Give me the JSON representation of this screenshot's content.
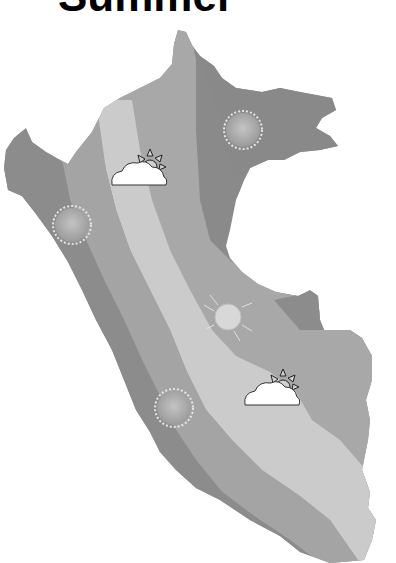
{
  "title": "Summer",
  "map": {
    "region": "Peru",
    "style": "grayscale climate zones",
    "zones": [
      {
        "name": "coast",
        "color": "#8a8a8a"
      },
      {
        "name": "coast-inner",
        "color": "#a6a6a6"
      },
      {
        "name": "highlands",
        "color": "#c8c8c8"
      },
      {
        "name": "east-slope",
        "color": "#a8a8a8"
      },
      {
        "name": "jungle",
        "color": "#888888"
      }
    ],
    "markers": [
      {
        "icon": "sun-icon",
        "x": 243,
        "y": 130
      },
      {
        "icon": "partly-cloudy-icon",
        "x": 140,
        "y": 175
      },
      {
        "icon": "sun-icon",
        "x": 72,
        "y": 225
      },
      {
        "icon": "sun-outline-icon",
        "x": 228,
        "y": 293
      },
      {
        "icon": "partly-cloudy-icon",
        "x": 273,
        "y": 385
      },
      {
        "icon": "sun-icon",
        "x": 174,
        "y": 410
      }
    ]
  }
}
